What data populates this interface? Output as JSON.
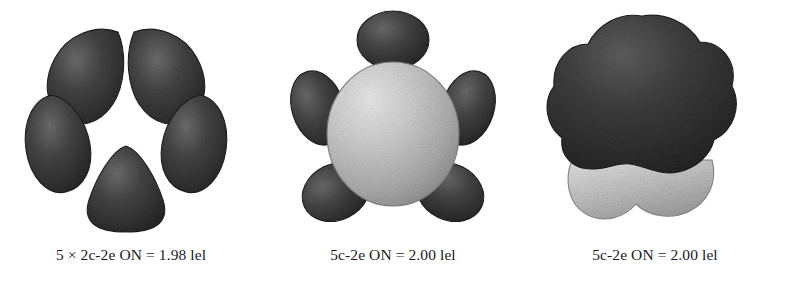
{
  "figure": {
    "background_color": "#ffffff",
    "kind": "molecular-orbital-isosurface-triptych",
    "panel_count": 3
  },
  "colors": {
    "lobe_dark": "#3a3a3a",
    "lobe_dark_edge": "#1c1c1c",
    "lobe_dark_highlight": "#6e6e6e",
    "lobe_light": "#b9b9b9",
    "lobe_light_highlight": "#e6e6e6",
    "lobe_light_edge": "#8a8a8a",
    "caption_color": "#1a1a1a"
  },
  "panels": [
    {
      "id": "panel-1",
      "caption": "5 × 2c-2e ON = 1.98 lel",
      "caption_parts": {
        "multiplicity": "5 ×",
        "bond_type": "2c-2e",
        "property": "ON",
        "equals": "=",
        "value": "1.98",
        "unit": "lel"
      },
      "description": "five dark teardrop lobes in a pentagonal ring with a hollow center",
      "lobe_count": 5,
      "center_lobe": "none",
      "shading": "dark"
    },
    {
      "id": "panel-2",
      "caption": "5c-2e ON = 2.00 lel",
      "caption_parts": {
        "multiplicity": "",
        "bond_type": "5c-2e",
        "property": "ON",
        "equals": "=",
        "value": "2.00",
        "unit": "lel"
      },
      "description": "large light-grey central sphere ringed by five dark elliptical lobes",
      "lobe_count": 5,
      "center_lobe": "light-sphere",
      "shading": "mixed"
    },
    {
      "id": "panel-3",
      "caption": "5c-2e ON = 2.00 lel",
      "caption_parts": {
        "multiplicity": "",
        "bond_type": "5c-2e",
        "property": "ON",
        "equals": "=",
        "value": "2.00",
        "unit": "lel"
      },
      "description": "single scalloped dark cloud with a light-grey lobe beneath it",
      "lobe_count": 1,
      "center_lobe": "merged-cloud",
      "shading": "dark-over-light"
    }
  ]
}
